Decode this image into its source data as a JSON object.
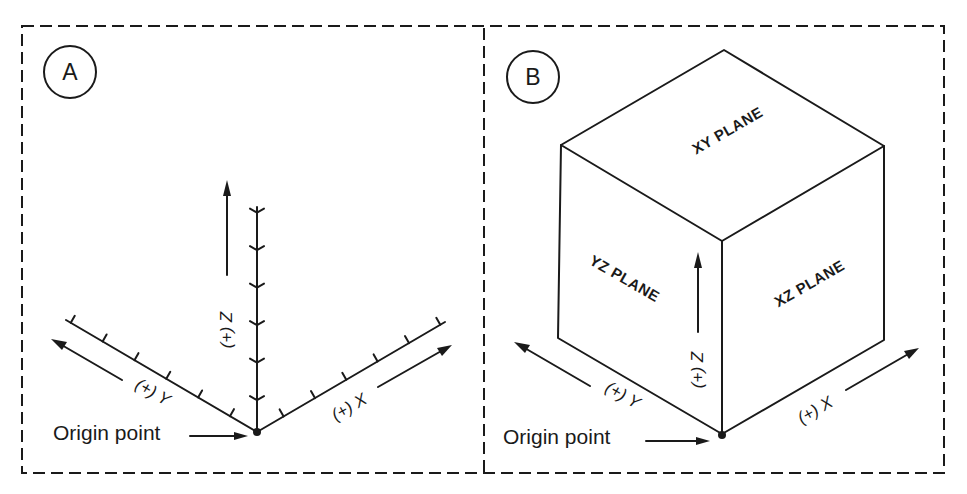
{
  "figure": {
    "panels": [
      {
        "id": "A",
        "badge": "A",
        "axes": {
          "x_label": "(+) X",
          "y_label": "(+) Y",
          "z_label": "(+) Z"
        },
        "tick_counts": {
          "x": 6,
          "y": 6,
          "z": 6
        },
        "origin_label": "Origin point"
      },
      {
        "id": "B",
        "badge": "B",
        "planes": {
          "top": "XY PLANE",
          "left": "YZ PLANE",
          "right": "XZ PLANE"
        },
        "axes": {
          "x_label": "(+) X",
          "y_label": "(+) Y",
          "z_label": "(+) Z"
        },
        "origin_label": "Origin point"
      }
    ],
    "ink_color": "#1a1a1a",
    "background": "#ffffff"
  }
}
